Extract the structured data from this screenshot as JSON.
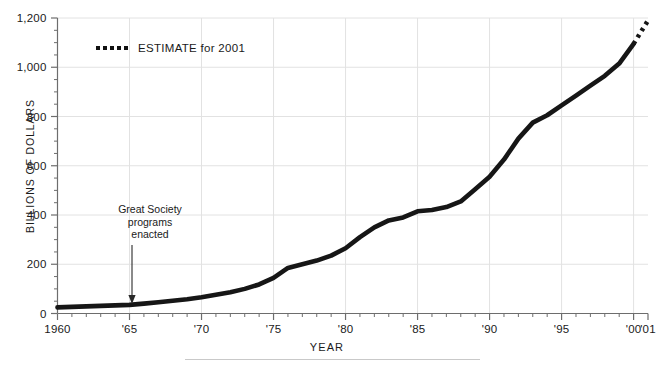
{
  "chart_data": {
    "type": "line",
    "title": "",
    "subtitle": "",
    "xlabel": "YEAR",
    "ylabel": "BILLIONS OF DOLLARS",
    "xlim": [
      1960,
      2001
    ],
    "ylim": [
      0,
      1200
    ],
    "grid": true,
    "legend_position": "top-left",
    "y_ticks": [
      0,
      200,
      400,
      600,
      800,
      1000,
      1200
    ],
    "y_tick_labels": [
      "0",
      "200",
      "400",
      "600",
      "800",
      "1,000",
      "1,200"
    ],
    "y_minor_step": 50,
    "x_ticks": [
      1960,
      1965,
      1970,
      1975,
      1980,
      1985,
      1990,
      1995,
      2000,
      2001
    ],
    "x_tick_labels": [
      "1960",
      "'65",
      "'70",
      "'75",
      "'80",
      "'85",
      "'90",
      "'95",
      "'00",
      "'01"
    ],
    "x_minor_step": 1,
    "line_color": "#161616",
    "grid_color": "#e2e2e2",
    "axis_color": "#6d6d6d",
    "series": [
      {
        "name": "Actual",
        "style": "solid",
        "x": [
          1960,
          1961,
          1962,
          1963,
          1964,
          1965,
          1966,
          1967,
          1968,
          1969,
          1970,
          1971,
          1972,
          1973,
          1974,
          1975,
          1976,
          1977,
          1978,
          1979,
          1980,
          1981,
          1982,
          1983,
          1984,
          1985,
          1986,
          1987,
          1988,
          1989,
          1990,
          1991,
          1992,
          1993,
          1994,
          1995,
          1996,
          1997,
          1998,
          1999,
          2000
        ],
        "values": [
          25,
          27,
          29,
          31,
          33,
          35,
          40,
          46,
          52,
          58,
          66,
          76,
          86,
          100,
          118,
          145,
          185,
          200,
          215,
          235,
          265,
          310,
          350,
          378,
          390,
          415,
          420,
          432,
          455,
          505,
          555,
          625,
          710,
          775,
          805,
          845,
          885,
          925,
          965,
          1015,
          1095
        ],
        "description": "Federal entitlement/social spending in billions of dollars, 1960-2000"
      },
      {
        "name": "ESTIMATE for 2001",
        "style": "dotted",
        "x": [
          2000,
          2001
        ],
        "values": [
          1095,
          1190
        ],
        "description": "Dotted projection segment from 2000 to 2001"
      }
    ],
    "annotations": [
      {
        "id": "great-society",
        "lines": [
          "Great Society",
          "programs",
          "enacted"
        ],
        "text": "Great Society programs enacted",
        "points_to_x": 1965,
        "points_to_y": 35,
        "arrow": "down"
      }
    ],
    "legend": [
      {
        "label": "ESTIMATE for 2001",
        "style": "dotted",
        "color": "#161616"
      }
    ]
  }
}
